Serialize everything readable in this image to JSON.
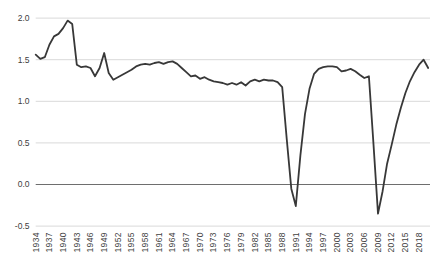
{
  "chart_data": {
    "type": "line",
    "title": "",
    "xlabel": "",
    "ylabel": "",
    "x": [
      1934,
      1935,
      1936,
      1937,
      1938,
      1939,
      1940,
      1941,
      1942,
      1943,
      1944,
      1945,
      1946,
      1947,
      1948,
      1949,
      1950,
      1951,
      1952,
      1953,
      1954,
      1955,
      1956,
      1957,
      1958,
      1959,
      1960,
      1961,
      1962,
      1963,
      1964,
      1965,
      1966,
      1967,
      1968,
      1969,
      1970,
      1971,
      1972,
      1973,
      1974,
      1975,
      1976,
      1977,
      1978,
      1979,
      1980,
      1981,
      1982,
      1983,
      1984,
      1985,
      1986,
      1987,
      1988,
      1989,
      1990,
      1991,
      1992,
      1993,
      1994,
      1995,
      1996,
      1997,
      1998,
      1999,
      2000,
      2001,
      2002,
      2003,
      2004,
      2005,
      2006,
      2007,
      2008,
      2009,
      2010,
      2011,
      2012,
      2013,
      2014,
      2015,
      2016,
      2017,
      2018,
      2019,
      2020
    ],
    "values": [
      1.56,
      1.51,
      1.53,
      1.68,
      1.78,
      1.81,
      1.88,
      1.97,
      1.93,
      1.44,
      1.41,
      1.42,
      1.4,
      1.3,
      1.4,
      1.58,
      1.34,
      1.26,
      1.29,
      1.32,
      1.35,
      1.38,
      1.42,
      1.44,
      1.45,
      1.44,
      1.46,
      1.47,
      1.45,
      1.47,
      1.48,
      1.45,
      1.4,
      1.35,
      1.3,
      1.31,
      1.27,
      1.29,
      1.26,
      1.24,
      1.23,
      1.22,
      1.2,
      1.22,
      1.2,
      1.23,
      1.19,
      1.24,
      1.26,
      1.24,
      1.26,
      1.25,
      1.25,
      1.23,
      1.17,
      0.55,
      -0.05,
      -0.26,
      0.35,
      0.85,
      1.15,
      1.33,
      1.39,
      1.41,
      1.42,
      1.42,
      1.41,
      1.36,
      1.37,
      1.39,
      1.36,
      1.32,
      1.28,
      1.3,
      0.5,
      -0.35,
      -0.08,
      0.25,
      0.48,
      0.72,
      0.92,
      1.1,
      1.24,
      1.35,
      1.44,
      1.5,
      1.4
    ],
    "ylim": [
      -0.5,
      2.0
    ],
    "grid": true,
    "legend": "none",
    "yticks": {
      "values": [
        2.0,
        1.5,
        1.0,
        0.5,
        0.0,
        -0.5
      ],
      "labels": [
        "2.0",
        "1.5",
        "1.0",
        "0.5",
        "0.0",
        "-0.5"
      ]
    },
    "xticks": {
      "years": [
        1934,
        1937,
        1940,
        1943,
        1946,
        1949,
        1952,
        1955,
        1958,
        1961,
        1964,
        1967,
        1970,
        1973,
        1976,
        1979,
        1982,
        1985,
        1988,
        1991,
        1994,
        1997,
        2000,
        2003,
        2006,
        2009,
        2012,
        2015,
        2018
      ],
      "labels": [
        "1934",
        "1937",
        "1940",
        "1943",
        "1946",
        "1949",
        "1952",
        "1955",
        "1958",
        "1961",
        "1964",
        "1967",
        "1970",
        "1973",
        "1976",
        "1979",
        "1982",
        "1985",
        "1988",
        "1991",
        "1994",
        "1997",
        "2000",
        "2003",
        "2006",
        "2009",
        "2012",
        "2015",
        "2018"
      ]
    },
    "colors": {
      "line": "#383838",
      "gridline": "#d9d9d9",
      "zero_axis": "#6e6e6e",
      "tick_label": "#404040",
      "background": "#ffffff"
    }
  }
}
